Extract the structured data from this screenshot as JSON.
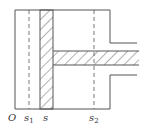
{
  "colors": {
    "line": "#555555",
    "hatch": "#555555",
    "text": "#333333",
    "background": "#ffffff"
  },
  "labels": {
    "origin": "O",
    "s1": {
      "base": "s",
      "sub": "1"
    },
    "s": {
      "base": "s"
    },
    "s2": {
      "base": "s",
      "sub": "2"
    }
  }
}
